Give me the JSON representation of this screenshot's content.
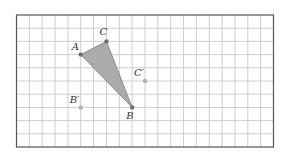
{
  "diagram": {
    "type": "coordinate-grid-figure",
    "grid": {
      "columns": 20,
      "rows": 10,
      "origin_px": [
        16.5,
        15
      ],
      "cell_w_px": 12.85,
      "cell_h_px": 13.2,
      "line_color": "#c8c8c8",
      "border_color": "#555555"
    },
    "triangle": {
      "fill": "#ababab",
      "stroke": "#7a7a7a",
      "vertices": [
        "A",
        "B",
        "C"
      ]
    },
    "points": [
      {
        "id": "A",
        "label": "A",
        "col": 5,
        "row": 3,
        "color": "#6e6e6e",
        "label_dx": -9,
        "label_dy": -5
      },
      {
        "id": "C",
        "label": "C",
        "col": 7,
        "row": 2,
        "color": "#6e6e6e",
        "label_dx": -7,
        "label_dy": -6
      },
      {
        "id": "B",
        "label": "B",
        "col": 9,
        "row": 7,
        "color": "#6e6e6e",
        "label_dx": -6,
        "label_dy": 12
      },
      {
        "id": "Cp",
        "label": "C′",
        "col": 10,
        "row": 5,
        "color": "#b0b0b0",
        "label_dx": -11,
        "label_dy": -5
      },
      {
        "id": "Bp",
        "label": "B′",
        "col": 5,
        "row": 7,
        "color": "#b0b0b0",
        "label_dx": -11,
        "label_dy": -4
      }
    ]
  }
}
